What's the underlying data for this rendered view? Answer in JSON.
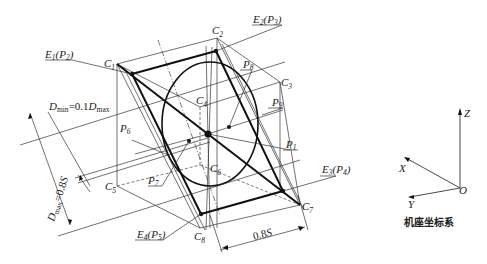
{
  "diagram": {
    "corner_labels": {
      "C1": {
        "base": "C",
        "sub": "1"
      },
      "C2": {
        "base": "C",
        "sub": "2"
      },
      "C3": {
        "base": "C",
        "sub": "3"
      },
      "C4": {
        "base": "C",
        "sub": "4"
      },
      "C5": {
        "base": "C",
        "sub": "5"
      },
      "C6": {
        "base": "C",
        "sub": "6"
      },
      "C7": {
        "base": "C",
        "sub": "7"
      },
      "C8": {
        "base": "C",
        "sub": "8"
      }
    },
    "edge_point_labels": {
      "E1": {
        "e": "E",
        "es": "1",
        "p": "P",
        "ps": "2"
      },
      "E2": {
        "e": "E",
        "es": "2",
        "p": "P",
        "ps": "3"
      },
      "E3": {
        "e": "E",
        "es": "3",
        "p": "P",
        "ps": "4"
      },
      "E4": {
        "e": "E",
        "es": "4",
        "p": "P",
        "ps": "5"
      }
    },
    "point_labels": {
      "P1": {
        "base": "P",
        "sub": "1"
      },
      "P6": {
        "base": "P",
        "sub": "6"
      },
      "P7": {
        "base": "P",
        "sub": "7"
      },
      "P8": {
        "base": "P",
        "sub": "8"
      },
      "P9": {
        "base": "P",
        "sub": "9"
      }
    },
    "dimensions": {
      "dmin": {
        "a": "D",
        "asub": "min",
        "eq": "=0.1",
        "b": "D",
        "bsub": "max"
      },
      "dmax": {
        "a": "D",
        "asub": "max",
        "eq": "=0.8",
        "s": "S"
      },
      "bottom": {
        "num": "0.8",
        "s": "S"
      }
    },
    "axes": {
      "x": "X",
      "y": "Y",
      "z": "Z",
      "origin": "O",
      "caption": "机座坐标系"
    }
  }
}
